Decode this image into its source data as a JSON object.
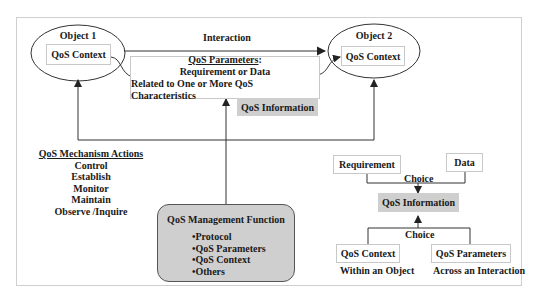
{
  "object1": {
    "title": "Object 1",
    "context": "QoS Context"
  },
  "object2": {
    "title": "Object 2",
    "context": "QoS Context"
  },
  "interaction": {
    "label": "Interaction"
  },
  "parameters_box": {
    "title": "QoS Parameters",
    "title_suffix": ":",
    "line1": "Requirement or Data",
    "line2": "Related to One or More QoS Characteristics"
  },
  "qos_information_tag": "QoS Information",
  "mechanism_actions": {
    "title": "QoS Mechanism Actions",
    "items": [
      "Control",
      "Establish",
      "Monitor",
      "Maintain",
      "Observe /Inquire"
    ]
  },
  "management_function": {
    "title": "QoS Management Function",
    "items": [
      "•Protocol",
      "•QoS Parameters",
      "•QoS Context",
      "•Others"
    ]
  },
  "choice_tree": {
    "requirement": "Requirement",
    "data": "Data",
    "choice_top": "Choice",
    "center": "QoS Information",
    "choice_bottom": "Choice",
    "context": "QoS Context",
    "context_caption": "Within an Object",
    "parameters": "QoS Parameters",
    "parameters_caption": "Across an Interaction"
  },
  "colors": {
    "gray_fill": "#cfcfcf",
    "line": "#333333",
    "frame": "#cfcfcf"
  }
}
